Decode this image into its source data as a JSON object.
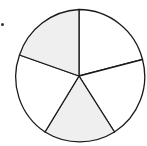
{
  "figure": {
    "total_parts": 5,
    "shaded_parts": 2,
    "shaded_sectors": [
      "top-left",
      "bottom"
    ],
    "colors": {
      "shaded": "#efefef",
      "unshaded": "#ffffff",
      "stroke": "#1a1a1a"
    }
  }
}
